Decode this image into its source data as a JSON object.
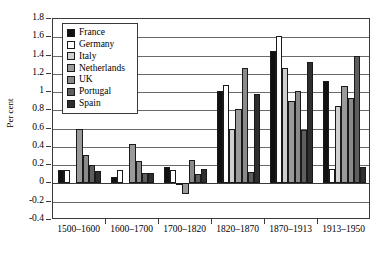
{
  "chart_data": {
    "type": "bar",
    "title": "",
    "subtitle": "",
    "xlabel": "",
    "ylabel": "Per cent",
    "ylim": [
      -0.4,
      1.8
    ],
    "ytick_step": 0.2,
    "yticks": [
      "1.8",
      "1.6",
      "1.4",
      "1.2",
      "1",
      "0.8",
      "0.6",
      "0.4",
      "0.2",
      "0",
      "-0.2",
      "-0.4"
    ],
    "ytick_values": [
      1.8,
      1.6,
      1.4,
      1.2,
      1.0,
      0.8,
      0.6,
      0.4,
      0.2,
      0,
      -0.2,
      -0.4
    ],
    "grid": true,
    "grid_axis": "y",
    "legend_position": "top-left-inside",
    "categories": [
      "1500–1600",
      "1600–1700",
      "1700–1820",
      "1820–1870",
      "1870–1913",
      "1913–1950"
    ],
    "series": [
      {
        "name": "France",
        "color": "#111111",
        "values": [
          0.15,
          0.07,
          0.18,
          1.01,
          1.45,
          1.12
        ]
      },
      {
        "name": "Germany",
        "color": "#ffffff",
        "values": [
          0.15,
          0.15,
          0.15,
          1.08,
          1.61,
          0.16
        ]
      },
      {
        "name": "Italy",
        "color": "#cfcfcf",
        "values": [
          0.0,
          0.0,
          0.01,
          0.6,
          1.26,
          0.85
        ]
      },
      {
        "name": "Netherlands",
        "color": "#9a9a9a",
        "values": [
          0.6,
          0.43,
          -0.12,
          0.81,
          0.9,
          1.07
        ]
      },
      {
        "name": "UK",
        "color": "#8a8a8a",
        "values": [
          0.31,
          0.25,
          0.26,
          1.26,
          1.01,
          0.93
        ]
      },
      {
        "name": "Portugal",
        "color": "#5e5e5e",
        "values": [
          0.2,
          0.11,
          0.1,
          0.12,
          0.59,
          1.39
        ]
      },
      {
        "name": "Spain",
        "color": "#2e2e2e",
        "values": [
          0.14,
          0.11,
          0.16,
          0.98,
          1.33,
          0.18
        ]
      }
    ]
  }
}
